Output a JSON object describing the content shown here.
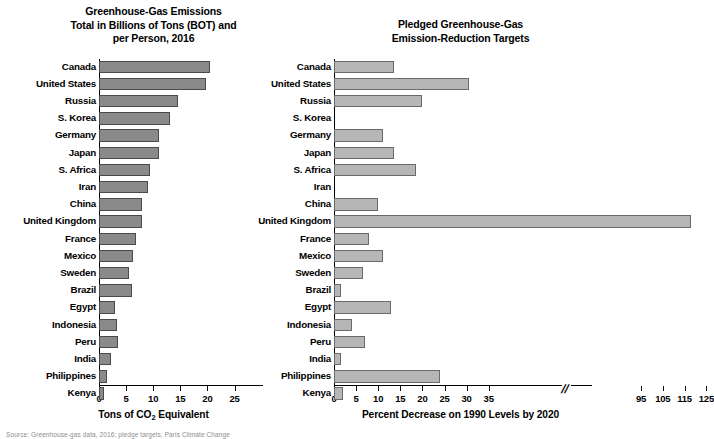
{
  "figure": {
    "source_note": "Source: Greenhouse-gas data, 2016; pledge targets, Paris Climate Change"
  },
  "chart_data": [
    {
      "type": "bar",
      "orientation": "horizontal",
      "panel": "left",
      "title": "Greenhouse-Gas Emissions Total in Billions of Tons (BOT) and per Person, 2016",
      "title_lines": [
        "Greenhouse-Gas Emissions",
        "Total in Billions of Tons (BOT) and",
        "per Person, 2016"
      ],
      "xlabel": "Tons of CO2 Equivalent",
      "ylabel": "",
      "xlim": [
        0,
        27
      ],
      "xticks": [
        0,
        5,
        10,
        15,
        20,
        25
      ],
      "xticklabels": [
        "0",
        "5",
        "10",
        "15",
        "20",
        "25"
      ],
      "grid": false,
      "legend": "none",
      "bar_color": "#8a8a8a",
      "categories": [
        "Canada",
        "United States",
        "Russia",
        "S. Korea",
        "Germany",
        "Japan",
        "S. Africa",
        "Iran",
        "China",
        "United Kingdom",
        "France",
        "Mexico",
        "Sweden",
        "Brazil",
        "Egypt",
        "Indonesia",
        "Peru",
        "India",
        "Philippines",
        "Kenya"
      ],
      "values": [
        20.4,
        19.8,
        14.5,
        13.1,
        11.1,
        11.0,
        9.5,
        9.0,
        7.9,
        8.0,
        6.9,
        6.2,
        5.6,
        6.0,
        3.0,
        3.4,
        3.5,
        2.3,
        1.4,
        1.0
      ]
    },
    {
      "type": "bar",
      "orientation": "horizontal",
      "panel": "right",
      "title": "Pledged Greenhouse-Gas Emission-Reduction Targets",
      "title_lines": [
        "Pledged Greenhouse-Gas",
        "Emission-Reduction Targets"
      ],
      "xlabel": "Percent Decrease on 1990 Levels by 2020",
      "ylabel": "",
      "xlim": [
        0,
        130
      ],
      "axis_break": {
        "after": 35,
        "before": 95,
        "symbol": "//"
      },
      "xticks": [
        0,
        5,
        10,
        15,
        20,
        25,
        30,
        35,
        95,
        105,
        115,
        125
      ],
      "xticklabels": [
        "0",
        "5",
        "10",
        "15",
        "20",
        "25",
        "30",
        "35",
        "95",
        "105",
        "115",
        "125"
      ],
      "grid": false,
      "legend": "none",
      "bar_color": "#b6b6b6",
      "categories": [
        "Canada",
        "United States",
        "Russia",
        "S. Korea",
        "Germany",
        "Japan",
        "S. Africa",
        "Iran",
        "China",
        "United Kingdom",
        "France",
        "Mexico",
        "Sweden",
        "Brazil",
        "Egypt",
        "Indonesia",
        "Peru",
        "India",
        "Philippines",
        "Kenya"
      ],
      "values": [
        13.5,
        30.5,
        20.0,
        0.0,
        11.0,
        13.5,
        18.5,
        0.0,
        10.0,
        118.0,
        8.0,
        11.0,
        6.5,
        1.5,
        13.0,
        4.0,
        7.0,
        1.5,
        24.0,
        2.0
      ],
      "values_note_kenya": 0.0
    }
  ]
}
